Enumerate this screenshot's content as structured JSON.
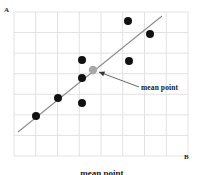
{
  "figure": {
    "axis_labels": {
      "y_axis": "A",
      "x_axis": "B"
    },
    "annotation": "mean point",
    "caption": "mean point",
    "colors": {
      "point": "#111111",
      "mean_point": "#a8a8a8",
      "grid": "#e2e2e2",
      "regression_line": "#8c8c8c",
      "text": "#1a1a1a",
      "background": "#ffffff"
    }
  },
  "chart_data": {
    "type": "scatter",
    "title": "",
    "xlabel": "B",
    "ylabel": "A",
    "grid": true,
    "legend": null,
    "xlim": [
      0,
      8
    ],
    "ylim": [
      0,
      7
    ],
    "x": [
      1.0,
      2.0,
      3.1,
      3.1,
      3.1,
      5.2,
      6.2,
      5.3
    ],
    "y": [
      1.85,
      2.7,
      4.45,
      3.6,
      2.45,
      6.3,
      5.65,
      3.95
    ],
    "points": [
      {
        "x": 1.0,
        "y": 1.85,
        "px": 36,
        "py": 116,
        "color": "#111111"
      },
      {
        "x": 2.0,
        "y": 2.7,
        "px": 58,
        "py": 98,
        "color": "#111111"
      },
      {
        "x": 3.1,
        "y": 4.45,
        "px": 82,
        "py": 60,
        "color": "#111111"
      },
      {
        "x": 3.1,
        "y": 3.6,
        "px": 82,
        "py": 78,
        "color": "#111111"
      },
      {
        "x": 3.1,
        "y": 2.45,
        "px": 82,
        "py": 103,
        "color": "#111111"
      },
      {
        "x": 5.2,
        "y": 6.3,
        "px": 128,
        "py": 21,
        "color": "#111111"
      },
      {
        "x": 6.2,
        "y": 5.65,
        "px": 150,
        "py": 34,
        "color": "#111111"
      },
      {
        "x": 5.3,
        "y": 3.95,
        "px": 129,
        "py": 61,
        "color": "#111111"
      }
    ],
    "mean_point": {
      "x": 3.6,
      "y": 3.95,
      "px": 93,
      "py": 70,
      "color": "#a8a8a8",
      "label": "mean point"
    },
    "regression_line": {
      "x1": 18,
      "y1": 132,
      "x2": 162,
      "y2": 16
    },
    "arrow": {
      "x1": 139,
      "y1": 87,
      "x2": 99,
      "y2": 72
    },
    "grid_rect": {
      "x": 14,
      "y": 12,
      "width": 174,
      "height": 144,
      "cols": 8,
      "rows": 7
    }
  }
}
